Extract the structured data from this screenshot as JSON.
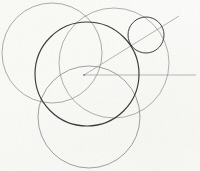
{
  "document": {
    "title": "Geometric circle construction sketch",
    "medium": "scanned line drawing on paper",
    "background_color": "#fcfcfa",
    "width": 200,
    "height": 171
  },
  "figure": {
    "caption": "Four overlapping large circles with a small circle at upper right and an angle drawn from the central point",
    "circles": [
      {
        "name": "main-circle",
        "label": "Central circle",
        "cx": 87,
        "cy": 74,
        "r": 52,
        "stroke_color": "#2b2b2b",
        "stroke_width": 1.15,
        "opacity": 0.92
      },
      {
        "name": "top-left-circle",
        "label": "Upper-left circle",
        "cx": 52,
        "cy": 53,
        "r": 50,
        "stroke_color": "#6f6f74",
        "stroke_width": 0.8,
        "opacity": 0.72
      },
      {
        "name": "right-circle",
        "label": "Right circle",
        "cx": 114,
        "cy": 63,
        "r": 55,
        "stroke_color": "#74747a",
        "stroke_width": 0.8,
        "opacity": 0.7
      },
      {
        "name": "bottom-circle",
        "label": "Lower circle",
        "cx": 89,
        "cy": 117,
        "r": 51,
        "stroke_color": "#6c6c72",
        "stroke_width": 0.85,
        "opacity": 0.75
      },
      {
        "name": "small-circle",
        "label": "Small upper-right circle",
        "cx": 146,
        "cy": 35,
        "r": 18,
        "stroke_color": "#303033",
        "stroke_width": 1.0,
        "opacity": 0.9
      }
    ],
    "lines": [
      {
        "name": "horizontal-ray",
        "label": "Horizontal ray from centre",
        "x1": 84,
        "y1": 75,
        "x2": 196,
        "y2": 75,
        "stroke_color": "#8c8c90",
        "stroke_width": 0.7,
        "opacity": 0.85
      },
      {
        "name": "diagonal-ray",
        "label": "Diagonal ray from centre through small circle",
        "x1": 84,
        "y1": 75,
        "x2": 179,
        "y2": 16,
        "stroke_color": "#87878c",
        "stroke_width": 0.7,
        "opacity": 0.88
      }
    ],
    "vertex": {
      "name": "angle-vertex",
      "label": "Angle vertex / circle centre",
      "x": 84,
      "y": 75
    }
  }
}
